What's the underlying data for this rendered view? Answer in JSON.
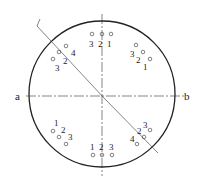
{
  "diagram": {
    "type": "bolt-hole circular pattern with section line",
    "axis_labels": {
      "left": "a",
      "right": "b"
    },
    "groups": [
      {
        "position": "top",
        "labels": [
          "3",
          "2",
          "1"
        ]
      },
      {
        "position": "upper-right",
        "labels": [
          "3",
          "2",
          "1"
        ]
      },
      {
        "position": "upper-left",
        "labels": [
          "4",
          "2",
          "3"
        ]
      },
      {
        "position": "lower-left",
        "labels": [
          "1",
          "2",
          "3"
        ]
      },
      {
        "position": "bottom",
        "labels": [
          "1",
          "2",
          "3"
        ]
      },
      {
        "position": "lower-right",
        "labels": [
          "3",
          "2",
          "4"
        ]
      }
    ],
    "colors": {
      "line": "#222222",
      "background": "#ffffff"
    }
  }
}
